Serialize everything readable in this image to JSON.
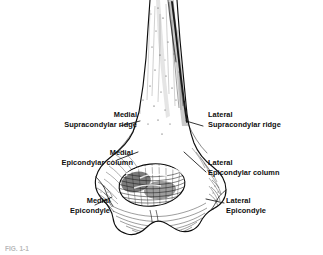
{
  "figure": {
    "type": "anatomical-line-illustration",
    "caption": "FIG. 1-1"
  },
  "labels": {
    "medial_supracondylar_ridge": {
      "line1": "Medial",
      "line2": "Supracondylar ridge"
    },
    "lateral_supracondylar_ridge": {
      "line1": "Lateral",
      "line2": "Supracondylar ridge"
    },
    "medial_epicondylar_column": {
      "line1": "Medial",
      "line2": "Epicondylar column"
    },
    "lateral_epicondylar_column": {
      "line1": "Lateral",
      "line2": "Epicondylar column"
    },
    "medial_epicondyle": {
      "line1": "Medial",
      "line2": "Epicondyle"
    },
    "lateral_epicondyle": {
      "line1": "Lateral",
      "line2": "Epicondyle"
    }
  },
  "colors": {
    "background": "#ffffff",
    "ink": "#101010",
    "leader_line": "#1a1a1a",
    "shading": "#3a3a3a",
    "caption_faded": "#b9b9b9"
  }
}
